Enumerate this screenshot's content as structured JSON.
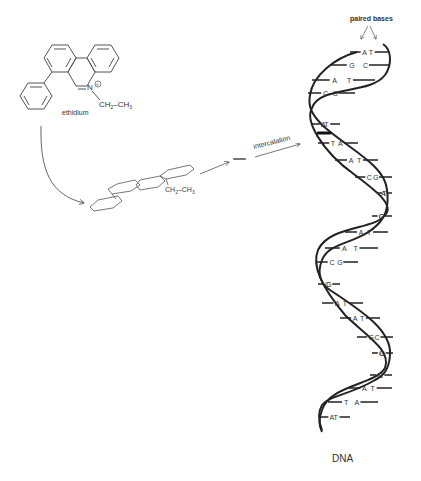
{
  "labels": {
    "ethidium": "ethidium",
    "intercalation": "intercalation",
    "paired_bases": "paired bases",
    "dna": "DNA",
    "nitrogen": "N",
    "ethyl_group": "CH2–CH3",
    "ethyl_ch2": "CH",
    "ethyl_sub2": "2",
    "ethyl_ch3": "CH",
    "ethyl_sub3": "3",
    "charge": "+"
  },
  "base_pairs": [
    {
      "left": "A",
      "right": "T"
    },
    {
      "left": "G",
      "right": "C"
    },
    {
      "left": "A",
      "right": "T"
    },
    {
      "left": "C",
      "right": "G"
    },
    {
      "left": "A",
      "right": "T",
      "intercalated": true
    },
    {
      "left": "T",
      "right": "A"
    },
    {
      "left": "A",
      "right": "T"
    },
    {
      "left": "C",
      "right": "G"
    },
    {
      "left": "T",
      "right": "A"
    },
    {
      "left": "G",
      "right": "C"
    },
    {
      "left": "A",
      "right": "T"
    },
    {
      "left": "A",
      "right": "T"
    },
    {
      "left": "C",
      "right": "G"
    },
    {
      "left": "C",
      "right": "G"
    },
    {
      "left": "A",
      "right": "T"
    },
    {
      "left": "A",
      "right": "T"
    },
    {
      "left": "G",
      "right": "C"
    },
    {
      "left": "G",
      "right": "C"
    },
    {
      "left": "G",
      "right": "C"
    },
    {
      "left": "A",
      "right": "T"
    },
    {
      "left": "T",
      "right": "A"
    },
    {
      "left": "A",
      "right": "T"
    }
  ]
}
